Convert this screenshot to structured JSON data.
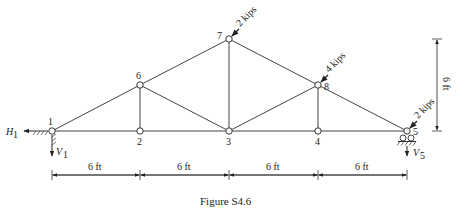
{
  "figure": {
    "caption": "Figure S4.6",
    "nodes": [
      {
        "id": "1",
        "label": "1",
        "x": 52,
        "y": 131
      },
      {
        "id": "2",
        "label": "2",
        "x": 140,
        "y": 131
      },
      {
        "id": "3",
        "label": "3",
        "x": 229,
        "y": 131
      },
      {
        "id": "4",
        "label": "4",
        "x": 318,
        "y": 131
      },
      {
        "id": "5",
        "label": "5",
        "x": 407,
        "y": 131
      },
      {
        "id": "6",
        "label": "6",
        "x": 140,
        "y": 85
      },
      {
        "id": "7",
        "label": "7",
        "x": 229,
        "y": 39
      },
      {
        "id": "8",
        "label": "8",
        "x": 318,
        "y": 85
      }
    ],
    "members": [
      [
        "1",
        "2"
      ],
      [
        "2",
        "3"
      ],
      [
        "3",
        "4"
      ],
      [
        "4",
        "5"
      ],
      [
        "1",
        "6"
      ],
      [
        "6",
        "7"
      ],
      [
        "7",
        "8"
      ],
      [
        "8",
        "5"
      ],
      [
        "2",
        "6"
      ],
      [
        "6",
        "3"
      ],
      [
        "3",
        "7"
      ],
      [
        "3",
        "8"
      ],
      [
        "8",
        "4"
      ]
    ],
    "loads": {
      "node7": "2 kips",
      "node8": "4 kips",
      "node5": "2 kips"
    },
    "reactions": {
      "h1": "H",
      "h1_sub": "1",
      "v1": "V",
      "v1_sub": "1",
      "v5": "V",
      "v5_sub": "5"
    },
    "dimensions": {
      "spans": [
        "6 ft",
        "6 ft",
        "6 ft",
        "6 ft"
      ],
      "height": "6 ft"
    }
  }
}
